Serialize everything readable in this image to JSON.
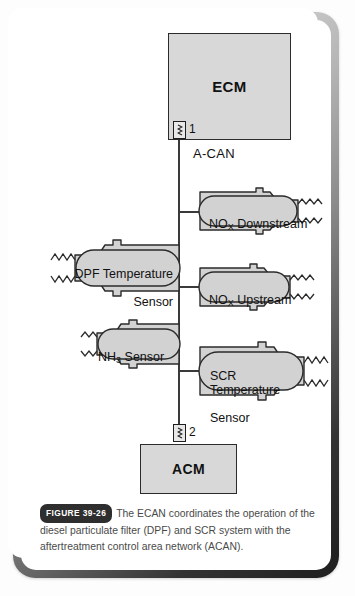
{
  "figure": {
    "badge": "FIGURE 39-26",
    "caption": "The ECAN coordinates the operation of the diesel particulate filter (DPF) and SCR system with the aftertreatment control area network (ACAN)."
  },
  "diagram": {
    "bus_label": "A-CAN",
    "modules": [
      {
        "id": "ecm",
        "label": "ECM"
      },
      {
        "id": "acm",
        "label": "ACM"
      }
    ],
    "connectors": [
      {
        "id": "connector-1",
        "number": "1",
        "attached_to": "ECM"
      },
      {
        "id": "connector-2",
        "number": "2",
        "attached_to": "ACM"
      }
    ],
    "sensors": [
      {
        "id": "nox-downstream",
        "name": "NOx Downstream",
        "label_html": "NO<sub>X</sub> Downstream",
        "side": "right"
      },
      {
        "id": "dpf-temperature",
        "name": "DPF Temperature Sensor",
        "label_line1": "DPF Temperature",
        "label_line2": "Sensor",
        "side": "left"
      },
      {
        "id": "nox-upstream",
        "name": "NOx Upstream",
        "label_html": "NO<sub>X</sub> Upstream",
        "side": "right"
      },
      {
        "id": "nh3-sensor",
        "name": "NH3 Sensor",
        "label_html": "NH<sub>3</sub> Sensor",
        "side": "left"
      },
      {
        "id": "scr-temperature",
        "name": "SCR Temperature Sensor",
        "label_line1": "SCR Temperature",
        "label_line2": "Sensor",
        "side": "right"
      }
    ],
    "colors": {
      "module_fill": "#d8d8d8",
      "sensor_fill": "#d2d2d2",
      "stroke": "#2b2b2b",
      "bus": "#3a3a3a",
      "badge_bg": "#2e2e2e"
    }
  }
}
